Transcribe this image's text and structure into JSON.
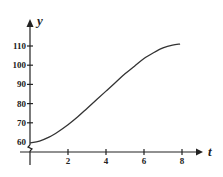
{
  "chart_data": {
    "type": "line",
    "title": "",
    "xlabel": "t",
    "ylabel": "y",
    "xlim": [
      0,
      8.5
    ],
    "ylim": [
      55,
      120
    ],
    "x_ticks": [
      2,
      4,
      6,
      8
    ],
    "x_tick_labels": [
      "2",
      "4",
      "6",
      "8"
    ],
    "y_ticks": [
      60,
      70,
      80,
      90,
      100,
      110
    ],
    "y_tick_labels": [
      "60",
      "70",
      "80",
      "90",
      "100",
      "110"
    ],
    "y_axis_break": true,
    "grid": false,
    "series": [
      {
        "name": "y(t)",
        "x": [
          0,
          0.5,
          1,
          1.5,
          2,
          2.5,
          3,
          3.5,
          4,
          4.5,
          5,
          5.5,
          6,
          6.5,
          7,
          7.5,
          7.9
        ],
        "values": [
          59.5,
          60.5,
          62.5,
          65.5,
          69,
          73,
          77.5,
          82,
          86.5,
          91,
          95.5,
          99.5,
          103.5,
          106.5,
          109,
          110.5,
          111
        ]
      }
    ]
  }
}
